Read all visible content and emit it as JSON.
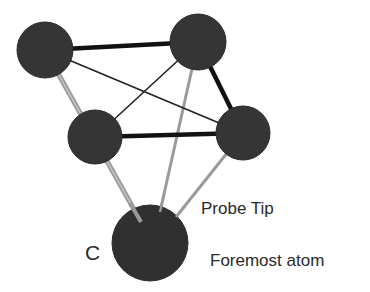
{
  "diagram": {
    "type": "atomic-probe-tip-network",
    "colors": {
      "node_fill": "#353535",
      "strong_bond": "#111111",
      "weak_bond": "#222222",
      "tip_bond": "#9a9a9a",
      "label_text": "#2a2a2a"
    },
    "nodes": [
      {
        "id": "atom-top-left",
        "cx": 45,
        "cy": 50,
        "r": 28
      },
      {
        "id": "atom-top-right",
        "cx": 198,
        "cy": 42,
        "r": 28
      },
      {
        "id": "atom-mid-left",
        "cx": 95,
        "cy": 137,
        "r": 27
      },
      {
        "id": "atom-mid-right",
        "cx": 243,
        "cy": 133,
        "r": 27
      },
      {
        "id": "atom-foremost",
        "cx": 150,
        "cy": 243,
        "r": 38
      }
    ],
    "edges": [
      {
        "from": "atom-top-left",
        "to": "atom-top-right",
        "style": "strong"
      },
      {
        "from": "atom-top-right",
        "to": "atom-mid-right",
        "style": "strong"
      },
      {
        "from": "atom-mid-left",
        "to": "atom-mid-right",
        "style": "strong"
      },
      {
        "from": "atom-top-left",
        "to": "atom-mid-right",
        "style": "weak"
      },
      {
        "from": "atom-top-right",
        "to": "atom-mid-left",
        "style": "weak"
      },
      {
        "from": "atom-top-left",
        "to": "atom-foremost",
        "style": "tip-double"
      },
      {
        "from": "atom-top-right",
        "to": "atom-foremost",
        "style": "tip"
      },
      {
        "from": "atom-mid-right",
        "to": "atom-foremost",
        "style": "tip"
      }
    ],
    "labels": {
      "probe_tip": "Probe Tip",
      "element": "C",
      "foremost_atom": "Foremost atom"
    }
  }
}
